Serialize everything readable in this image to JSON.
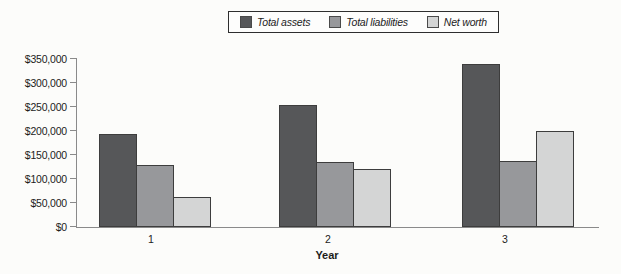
{
  "chart_data": {
    "type": "bar",
    "title": "",
    "xlabel": "Year",
    "ylabel": "",
    "categories": [
      "1",
      "2",
      "3"
    ],
    "series": [
      {
        "name": "Total assets",
        "color": "#565759",
        "values": [
          193000,
          255000,
          340000
        ]
      },
      {
        "name": "Total liabilities",
        "color": "#97989b",
        "values": [
          130000,
          135000,
          138000
        ]
      },
      {
        "name": "Net worth",
        "color": "#d4d5d5",
        "values": [
          62000,
          120000,
          199000
        ]
      }
    ],
    "ylim": [
      0,
      350000
    ],
    "ytick_step": 50000,
    "ytick_labels": [
      "$0",
      "$50,000",
      "$100,000",
      "$150,000",
      "$200,000",
      "$250,000",
      "$300,000",
      "$350,000"
    ],
    "legend_position": "top-center",
    "grid": false,
    "bar_border_color": "#3d3d3d",
    "axis_color": "#8a8a8a"
  }
}
